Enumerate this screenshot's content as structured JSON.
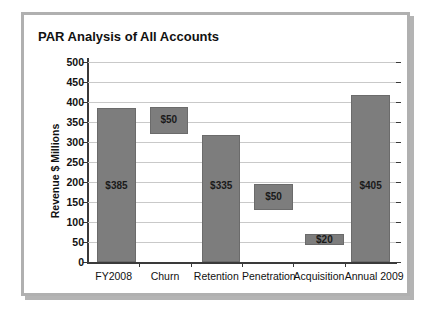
{
  "figure": {
    "label": "FIGURE 8-2"
  },
  "chart_data": {
    "type": "bar",
    "title": "PAR Analysis of All Accounts",
    "subtitle": "",
    "xlabel": "",
    "ylabel": "Revenue $ Millions",
    "ylim": [
      0,
      500
    ],
    "yticks": [
      0,
      50,
      100,
      150,
      200,
      250,
      300,
      350,
      400,
      450,
      500
    ],
    "ytick_labels": [
      "0",
      "50",
      "100",
      "150",
      "200",
      "250",
      "300",
      "350",
      "400",
      "450",
      "500"
    ],
    "grid": true,
    "legend": "none",
    "waterfall": true,
    "categories": [
      "FY2008",
      "Churn",
      "Retention",
      "Penetration",
      "Acquisition",
      "Annual 2009"
    ],
    "values": [
      385,
      50,
      335,
      50,
      20,
      405
    ],
    "data_labels": [
      "$385",
      "$50",
      "$335",
      "$50",
      "$20",
      "$405"
    ],
    "bars": [
      {
        "category": "FY2008",
        "label": "$385",
        "value": 385,
        "base": 0,
        "top": 385,
        "kind": "total"
      },
      {
        "category": "Churn",
        "label": "$50",
        "value": 50,
        "base": 335,
        "top": 385,
        "kind": "decrease"
      },
      {
        "category": "Retention",
        "label": "$335",
        "value": 335,
        "base": 0,
        "top": 335,
        "kind": "total"
      },
      {
        "category": "Penetration",
        "label": "$50",
        "value": 50,
        "base": 335,
        "top": 385,
        "kind": "increase"
      },
      {
        "category": "Acquisition",
        "label": "$20",
        "value": 20,
        "base": 385,
        "top": 405,
        "kind": "increase"
      },
      {
        "category": "Annual 2009",
        "label": "$405",
        "value": 405,
        "base": 0,
        "top": 405,
        "kind": "total"
      }
    ],
    "bar_geometry": [
      {
        "x_pct": 3.0,
        "w_pct": 12.5,
        "bottom_val": 0,
        "top_val": 385,
        "label": "$385",
        "label_val": 190
      },
      {
        "x_pct": 20.0,
        "w_pct": 12.5,
        "bottom_val": 320,
        "top_val": 388,
        "label": "$50",
        "label_val": 354
      },
      {
        "x_pct": 37.0,
        "w_pct": 12.5,
        "bottom_val": 0,
        "top_val": 318,
        "label": "$335",
        "label_val": 190
      },
      {
        "x_pct": 54.0,
        "w_pct": 12.5,
        "bottom_val": 130,
        "top_val": 196,
        "label": "$50",
        "label_val": 163
      },
      {
        "x_pct": 70.5,
        "w_pct": 12.5,
        "bottom_val": 42,
        "top_val": 70,
        "label": "$20",
        "label_val": 56
      },
      {
        "x_pct": 85.5,
        "w_pct": 12.5,
        "bottom_val": 0,
        "top_val": 417,
        "label": "$405",
        "label_val": 190
      }
    ],
    "colors": {
      "bar_fill": "#7d7d7d",
      "bar_stroke": "#6b6b6b",
      "grid": "#c9c9c9",
      "axis": "#3a3a3a",
      "text": "#111111",
      "frame": "#b0b0b0",
      "figure_label": "#a8a8a8"
    }
  }
}
